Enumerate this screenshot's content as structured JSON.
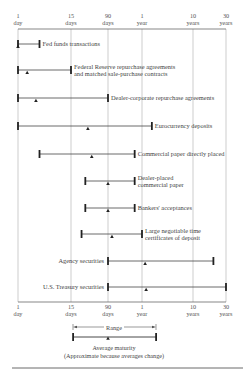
{
  "chart_data": {
    "type": "range-bar",
    "title": "",
    "xscale": "maturity (days), nonuniform log-like scale",
    "ticks": [
      {
        "value": 1,
        "line1": "1",
        "line2": "day"
      },
      {
        "value": 15,
        "line1": "15",
        "line2": "days"
      },
      {
        "value": 90,
        "line1": "90",
        "line2": "days"
      },
      {
        "value": 365,
        "line1": "1",
        "line2": "year"
      },
      {
        "value": 3650,
        "line1": "10",
        "line2": "years"
      },
      {
        "value": 10950,
        "line1": "30",
        "line2": "years"
      }
    ],
    "series": [
      {
        "name": "Fed funds transactions",
        "lines": [
          "Fed funds transactions"
        ],
        "min_days": 1,
        "max_days": 3,
        "avg_days": 1,
        "label_side": "right"
      },
      {
        "name": "Federal Reserve repurchase agreements and matched sale-purchase contracts",
        "lines": [
          "Federal Reserve repurchase agreements",
          "and matched sale-purchase contracts"
        ],
        "min_days": 1,
        "max_days": 15,
        "avg_days": 1.6,
        "label_side": "right"
      },
      {
        "name": "Dealer-corporate repurchase agreements",
        "lines": [
          "Dealer-corporate repurchase agreements"
        ],
        "min_days": 1,
        "max_days": 90,
        "avg_days": 2.5,
        "label_side": "right"
      },
      {
        "name": "Eurocurrency deposits",
        "lines": [
          "Eurocurrency deposits"
        ],
        "min_days": 1,
        "max_days": 570,
        "avg_days": 34,
        "label_side": "right"
      },
      {
        "name": "Commercial paper directly placed",
        "lines": [
          "Commercial paper directly placed"
        ],
        "min_days": 3,
        "max_days": 270,
        "avg_days": 41,
        "label_side": "right"
      },
      {
        "name": "Dealer-placed commercial paper",
        "lines": [
          "Dealer-placed",
          "commercial paper"
        ],
        "min_days": 30,
        "max_days": 270,
        "avg_days": 90,
        "label_side": "right"
      },
      {
        "name": "Bankers' acceptances",
        "lines": [
          "Bankers' acceptances"
        ],
        "min_days": 30,
        "max_days": 270,
        "avg_days": 90,
        "label_side": "right"
      },
      {
        "name": "Large negotiable time certificates of deposit",
        "lines": [
          "Large negotiable time",
          "certificates of deposit"
        ],
        "min_days": 25,
        "max_days": 365,
        "avg_days": 106,
        "label_side": "right"
      },
      {
        "name": "Agency securities",
        "lines": [
          "Agency securities"
        ],
        "min_days": 90,
        "max_days": 7200,
        "avg_days": 420,
        "label_side": "left"
      },
      {
        "name": "U.S. Treasury securities",
        "lines": [
          "U.S. Treasury securities"
        ],
        "min_days": 90,
        "max_days": 10950,
        "avg_days": 440,
        "label_side": "left"
      }
    ],
    "legend": {
      "range_label": "Range",
      "caption_line1": "Average maturity",
      "caption_line2": "(Approximate because averages change)",
      "placement": "bottom-center"
    }
  }
}
